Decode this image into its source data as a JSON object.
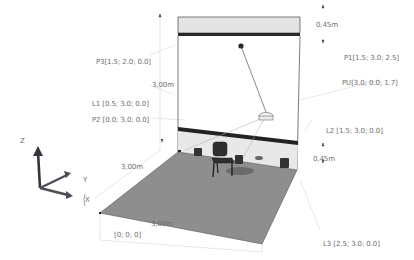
{
  "diagram": {
    "type": "3d-room-schematic",
    "colors": {
      "wall_band": "#e2e2e2",
      "wall_stripe": "#2c2c2c",
      "floor": "#8d8d8d",
      "lines": "#333333",
      "dim_lines": "#cfcfcf",
      "label_text": "#6e6e6e",
      "axis_arrow": "#3a3f46"
    },
    "labels": {
      "P1": "P1[1.5; 3.0; 2.5]",
      "PU": "PU[3.0; 0.0; 1.7]",
      "P3": "P3[1.5; 2.0; 0.0]",
      "L1": "L1 [0.5; 3.0; 0.0]",
      "P2": "P2 [0.0; 3.0; 0.0]",
      "L2": "L2 [1.5; 3.0; 0.0]",
      "L3": "L3 [2.5; 3.0; 0.0]",
      "origin": "[0; 0; 0]"
    },
    "dimensions": {
      "top_band": "0,45m",
      "bottom_band": "0,45m",
      "height": "3,00m",
      "depth": "3,00m",
      "width": "3,00m"
    },
    "axes": {
      "z": "Z",
      "y": "Y",
      "x": "X"
    }
  }
}
